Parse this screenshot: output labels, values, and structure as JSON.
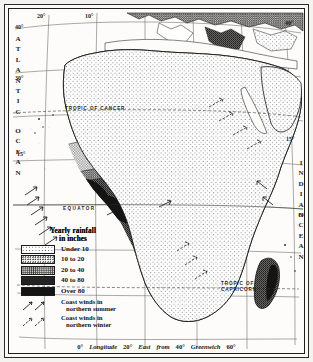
{
  "map": {
    "title": "Africa — Yearly Rainfall",
    "subject": "Africa rainfall distribution map",
    "ocean_left": "ATLANTIC",
    "ocean_left_2": "OCEAN",
    "ocean_right": "INDIAN",
    "ocean_right_2": "OCEAN",
    "equator_label": "EQUATOR",
    "tropic_cancer_label": "TROPIC OF CANCER",
    "tropic_capricorn_label_1": "TROPIC OF",
    "tropic_capricorn_label_2": "CAPRICORN"
  },
  "graticule": {
    "top_labels": [
      {
        "text": "20°",
        "x": 36,
        "y": 9
      },
      {
        "text": "10°",
        "x": 83,
        "y": 9
      }
    ],
    "left_labels": [
      {
        "text": "40°",
        "x": 14,
        "y": 22
      },
      {
        "text": "30°",
        "x": 14,
        "y": 72
      },
      {
        "text": "15°",
        "x": 16,
        "y": 148
      }
    ],
    "right_labels": [
      {
        "text": "40°",
        "x": 282,
        "y": 18
      },
      {
        "text": "15°",
        "x": 283,
        "y": 133
      }
    ],
    "bottom_labels": [
      {
        "text": "0°",
        "x": 111,
        "y": 341
      },
      {
        "text": "20°",
        "x": 160,
        "y": 341
      },
      {
        "text": "40°",
        "x": 213,
        "y": 341
      },
      {
        "text": "60°",
        "x": 258,
        "y": 341
      }
    ]
  },
  "bottom_caption": {
    "deg_0": "0°",
    "longitude": "Longitude",
    "deg_20": "20°",
    "east": "East",
    "from": "from",
    "deg_40": "40°",
    "greenwich": "Greenwich",
    "deg_60": "60°"
  },
  "legend": {
    "title_line1": "Yearly rainfall",
    "title_line2": "in inches",
    "classes": [
      {
        "label": "Under 10",
        "swatch": "sw-under10",
        "color": "#ffffff",
        "min": null,
        "max": 10
      },
      {
        "label": "10 to 20",
        "swatch": "sw-10-20",
        "color": "#e4e3e0",
        "min": 10,
        "max": 20
      },
      {
        "label": "20 to 40",
        "swatch": "sw-20-40",
        "color": "#cfcdc9",
        "min": 20,
        "max": 40
      },
      {
        "label": "40 to 80",
        "swatch": "sw-40-80",
        "color": "#8d8b87",
        "min": 40,
        "max": 80
      },
      {
        "label": "Over 80",
        "swatch": "sw-over80",
        "color": "#141414",
        "min": 80,
        "max": null
      }
    ],
    "winds": [
      {
        "line1": "Coast winds in",
        "line2": "northern summer",
        "key": "wind-summer"
      },
      {
        "line1": "Coast winds in",
        "line2": "northern winter",
        "key": "wind-winter"
      }
    ]
  },
  "colors": {
    "ink": "#1b1b1b",
    "paper": "#fcfbf8",
    "border": "#1d1d1d"
  }
}
